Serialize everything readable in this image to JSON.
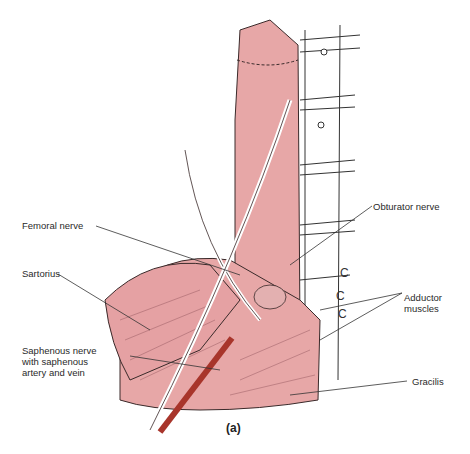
{
  "figure": {
    "caption": "(a)",
    "colors": {
      "muscle": "#e7a7a7",
      "muscle_shadow": "#b66a72",
      "nerve": "#ffffff",
      "artery": "#a8352b",
      "outline": "#3a2a2a",
      "leader_line": "#333333"
    },
    "labels": [
      {
        "id": "femoral-nerve",
        "text": "Femoral nerve"
      },
      {
        "id": "obturator-nerve",
        "text": "Obturator nerve"
      },
      {
        "id": "sartorius",
        "text": "Sartorius"
      },
      {
        "id": "saphenous",
        "text": "Saphenous nerve\nwith saphenous\nartery and vein"
      },
      {
        "id": "adductor",
        "text": "Adductor\nmuscles"
      },
      {
        "id": "gracilis",
        "text": "Gracilis"
      }
    ]
  }
}
